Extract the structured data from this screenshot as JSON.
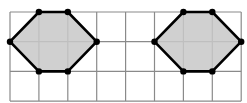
{
  "diagram": {
    "grid": {
      "columns": 8,
      "rows": 3
    },
    "colors": {
      "grid_line": "#8a8a8a",
      "shape_fill": "#c8c8c8",
      "shape_stroke": "#000000",
      "background": "#ffffff"
    },
    "shapes": [
      {
        "name": "left-hexagon",
        "vertices": [
          [
            1,
            0
          ],
          [
            2,
            0
          ],
          [
            3,
            1
          ],
          [
            2,
            2
          ],
          [
            1,
            2
          ],
          [
            0,
            1
          ]
        ]
      },
      {
        "name": "right-hexagon",
        "vertices": [
          [
            6,
            0
          ],
          [
            7,
            0
          ],
          [
            8,
            1
          ],
          [
            7,
            2
          ],
          [
            6,
            2
          ],
          [
            5,
            1
          ]
        ]
      }
    ]
  }
}
